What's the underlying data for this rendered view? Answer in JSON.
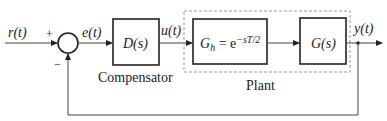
{
  "diagram": {
    "type": "feedback-control-block-diagram",
    "signals": {
      "input": "r(t)",
      "error": "e(t)",
      "control": "u(t)",
      "output": "y(t)"
    },
    "summing_junction": {
      "plus_sign": "+",
      "minus_sign": "−"
    },
    "blocks": {
      "compensator": {
        "label": "D(s)",
        "caption": "Compensator"
      },
      "hold": {
        "label_main": "G",
        "label_sub": "h",
        "label_eq": " = e",
        "label_exp": "−sT/2"
      },
      "plant_tf": {
        "label": "G(s)"
      }
    },
    "plant_group": {
      "caption": "Plant"
    },
    "colors": {
      "line": "#222222",
      "dashed_border": "#999999",
      "block_border": "#222222"
    }
  }
}
